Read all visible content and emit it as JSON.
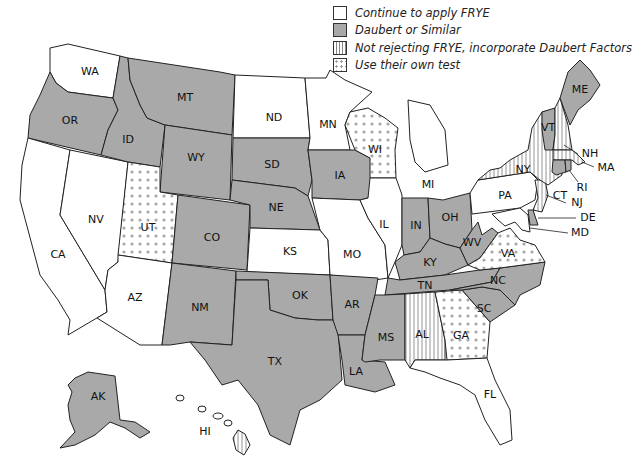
{
  "legend": {
    "items": [
      {
        "key": "frye",
        "label": "Continue to apply FRYE",
        "pattern": "white",
        "color": "#ffffff"
      },
      {
        "key": "daubert",
        "label": "Daubert or Similar",
        "pattern": "solid-gray",
        "color": "#a9a9a9"
      },
      {
        "key": "hybrid",
        "label": "Not rejecting FRYE, incorporate Daubert Factors",
        "pattern": "vertical-stripes",
        "color": "#888888"
      },
      {
        "key": "own",
        "label": "Use their own test",
        "pattern": "dots",
        "color": "#a0a0a0"
      }
    ]
  },
  "states": {
    "WA": {
      "label": "WA",
      "category": "frye"
    },
    "OR": {
      "label": "OR",
      "category": "daubert"
    },
    "CA": {
      "label": "CA",
      "category": "frye"
    },
    "NV": {
      "label": "NV",
      "category": "frye"
    },
    "ID": {
      "label": "ID",
      "category": "daubert"
    },
    "MT": {
      "label": "MT",
      "category": "daubert"
    },
    "WY": {
      "label": "WY",
      "category": "daubert"
    },
    "UT": {
      "label": "UT",
      "category": "own"
    },
    "AZ": {
      "label": "AZ",
      "category": "frye"
    },
    "CO": {
      "label": "CO",
      "category": "daubert"
    },
    "NM": {
      "label": "NM",
      "category": "daubert"
    },
    "ND": {
      "label": "ND",
      "category": "frye"
    },
    "SD": {
      "label": "SD",
      "category": "daubert"
    },
    "NE": {
      "label": "NE",
      "category": "daubert"
    },
    "KS": {
      "label": "KS",
      "category": "frye"
    },
    "OK": {
      "label": "OK",
      "category": "daubert"
    },
    "TX": {
      "label": "TX",
      "category": "daubert"
    },
    "MN": {
      "label": "MN",
      "category": "frye"
    },
    "IA": {
      "label": "IA",
      "category": "daubert"
    },
    "MO": {
      "label": "MO",
      "category": "frye"
    },
    "AR": {
      "label": "AR",
      "category": "daubert"
    },
    "LA": {
      "label": "LA",
      "category": "daubert"
    },
    "WI": {
      "label": "WI",
      "category": "own"
    },
    "IL": {
      "label": "IL",
      "category": "frye"
    },
    "MI": {
      "label": "MI",
      "category": "frye"
    },
    "IN": {
      "label": "IN",
      "category": "daubert"
    },
    "OH": {
      "label": "OH",
      "category": "daubert"
    },
    "KY": {
      "label": "KY",
      "category": "daubert"
    },
    "TN": {
      "label": "TN",
      "category": "daubert"
    },
    "MS": {
      "label": "MS",
      "category": "daubert"
    },
    "AL": {
      "label": "AL",
      "category": "hybrid"
    },
    "GA": {
      "label": "GA",
      "category": "own"
    },
    "FL": {
      "label": "FL",
      "category": "frye"
    },
    "SC": {
      "label": "SC",
      "category": "daubert"
    },
    "NC": {
      "label": "NC",
      "category": "daubert"
    },
    "VA": {
      "label": "VA",
      "category": "own"
    },
    "WV": {
      "label": "WV",
      "category": "daubert"
    },
    "PA": {
      "label": "PA",
      "category": "frye"
    },
    "NY": {
      "label": "NY",
      "category": "hybrid"
    },
    "VT": {
      "label": "VT",
      "category": "daubert"
    },
    "NH": {
      "label": "NH",
      "category": "hybrid"
    },
    "ME": {
      "label": "ME",
      "category": "daubert"
    },
    "MA": {
      "label": "MA",
      "category": "hybrid"
    },
    "CT": {
      "label": "CT",
      "category": "daubert"
    },
    "RI": {
      "label": "RI",
      "category": "daubert"
    },
    "NJ": {
      "label": "NJ",
      "category": "hybrid"
    },
    "DE": {
      "label": "DE",
      "category": "daubert"
    },
    "MD": {
      "label": "MD",
      "category": "frye"
    },
    "AK": {
      "label": "AK",
      "category": "daubert"
    },
    "HI": {
      "label": "HI",
      "category": "hybrid"
    }
  }
}
